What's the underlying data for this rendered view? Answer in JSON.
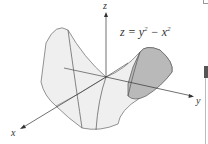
{
  "figure": {
    "equation": {
      "lhs": "z",
      "eq": "=",
      "term1_base": "y",
      "term1_exp": "2",
      "minus": "−",
      "term2_base": "x",
      "term2_exp": "2"
    },
    "axes": {
      "x_label": "x",
      "y_label": "y",
      "z_label": "z"
    },
    "surface": {
      "name": "hyperbolic paraboloid (saddle)",
      "light_fill": "#eeeeee",
      "dark_fill": "#b5b5b5",
      "edge_color": "#666666"
    }
  }
}
